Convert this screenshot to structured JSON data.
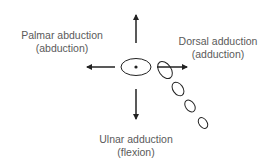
{
  "labels": {
    "palmar": {
      "line1": "Palmar abduction",
      "line2": "(abduction)"
    },
    "dorsal": {
      "line1": "Dorsal adduction",
      "line2": "(adduction)"
    },
    "ulnar": {
      "line1": "Ulnar adduction",
      "line2": "(flexion)"
    }
  },
  "colors": {
    "stroke": "#222222",
    "text": "#5a5a5a"
  }
}
